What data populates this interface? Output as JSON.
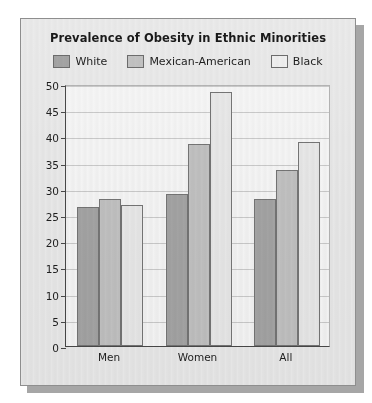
{
  "chart_data": {
    "type": "bar",
    "title": "Prevalence of Obesity in Ethnic Minorities",
    "xlabel": "",
    "ylabel": "",
    "categories": [
      "Men",
      "Women",
      "All"
    ],
    "series": [
      {
        "name": "White",
        "values": [
          26.5,
          29.0,
          28.0
        ],
        "color": "#a8a8a8"
      },
      {
        "name": "Mexican-American",
        "values": [
          28.0,
          38.5,
          33.5
        ],
        "color": "#c6c6c6"
      },
      {
        "name": "Black",
        "values": [
          27.0,
          48.5,
          39.0
        ],
        "color": "#eeeeee"
      }
    ],
    "ylim": [
      0,
      50
    ],
    "yticks": [
      0,
      5,
      10,
      15,
      20,
      25,
      30,
      35,
      40,
      45,
      50
    ],
    "ytick_labels": [
      "0",
      "5",
      "10",
      "15",
      "20",
      "25",
      "30",
      "35",
      "40",
      "45",
      "50"
    ],
    "grid": true,
    "legend_position": "top"
  },
  "legend": {
    "items": [
      {
        "label": "White",
        "swatch": "#a8a8a8"
      },
      {
        "label": "Mexican-American",
        "swatch": "#c6c6c6"
      },
      {
        "label": "Black",
        "swatch": "#f4f4f4"
      }
    ]
  }
}
